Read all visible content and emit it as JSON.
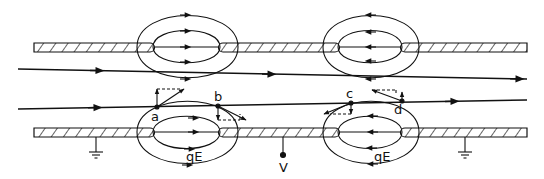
{
  "diagram": {
    "type": "electrostatic-lens-beam-diagram",
    "labels": {
      "point_a": "a",
      "point_b": "b",
      "point_c": "c",
      "point_d": "d",
      "force_left": "qE",
      "force_right": "qE",
      "voltage": "V"
    },
    "colors": {
      "ink": "#111111",
      "background": "#ffffff"
    },
    "elements": {
      "electrodes": [
        "upper-tube",
        "lower-tube"
      ],
      "lenses": [
        "left-lens-field",
        "right-lens-field"
      ],
      "beams": [
        "upper-trajectory",
        "lower-trajectory"
      ],
      "grounds": [
        "left-ground",
        "right-ground"
      ],
      "terminal": "voltage-terminal"
    }
  }
}
